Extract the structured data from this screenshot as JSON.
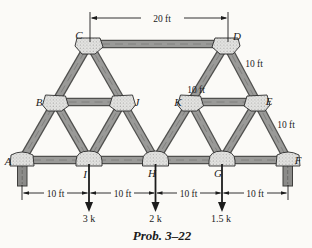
{
  "figure": {
    "caption": "Prob. 3–22",
    "joint_labels": {
      "A": "A",
      "B": "B",
      "C": "C",
      "D": "D",
      "E": "E",
      "F": "F",
      "G": "G",
      "H": "H",
      "I": "I",
      "J": "J",
      "K": "K"
    },
    "dimensions": {
      "top_span": "20 ft",
      "diag_de": "10 ft",
      "mid_ke": "10 ft",
      "diag_ef": "10 ft",
      "bottom_spans": [
        "10 ft",
        "10 ft",
        "10 ft",
        "10 ft"
      ]
    },
    "loads": [
      {
        "at_joint": "I",
        "label": "3 k"
      },
      {
        "at_joint": "H",
        "label": "2 k"
      },
      {
        "at_joint": "G",
        "label": "1.5 k"
      }
    ],
    "colors": {
      "member_fill": "#9a9a98",
      "member_edge": "#50504e",
      "gusset_fill": "#e4e4e2",
      "ink": "#1c1c1c",
      "background": "#fbfaf7"
    }
  }
}
